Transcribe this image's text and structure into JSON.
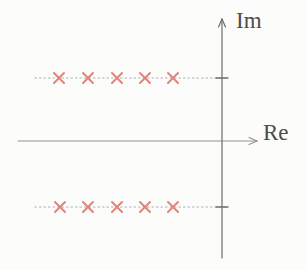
{
  "figure": {
    "width": 307,
    "height": 270,
    "background": "#fcfcfb",
    "type": "complex-plane-pole-plot",
    "axes": {
      "origin": {
        "x": 222,
        "y": 141
      },
      "im_axis": {
        "label": "Im",
        "top": 19,
        "bottom": 258,
        "color": "#6c6c6c",
        "label_x": 236,
        "label_y": 9
      },
      "re_axis": {
        "label": "Re",
        "left": 18,
        "right": 257,
        "color": "#949494",
        "label_x": 263,
        "label_y": 121
      },
      "label_color": "#4c4c4c"
    },
    "dashed_lines": {
      "color": "#a8b3b6",
      "x_start": 35,
      "x_end": 228,
      "rows": [
        {
          "y": 78
        },
        {
          "y": 207
        }
      ]
    },
    "axis_ticks": {
      "color": "#6f6f6f",
      "half_width": 6,
      "ys": [
        78,
        207
      ]
    },
    "markers": {
      "glyph": "x-cross",
      "color": "#e2837a",
      "size": 10,
      "stroke_width": 2,
      "points": [
        {
          "x": 59,
          "y": 78
        },
        {
          "x": 88,
          "y": 78
        },
        {
          "x": 117,
          "y": 78
        },
        {
          "x": 145,
          "y": 78
        },
        {
          "x": 173,
          "y": 78
        },
        {
          "x": 60,
          "y": 207
        },
        {
          "x": 88,
          "y": 207
        },
        {
          "x": 117,
          "y": 207
        },
        {
          "x": 145,
          "y": 207
        },
        {
          "x": 173,
          "y": 207
        }
      ]
    }
  }
}
